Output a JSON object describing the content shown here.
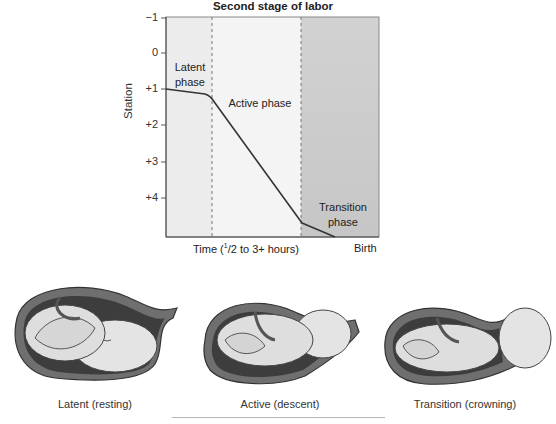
{
  "figure": {
    "title": "Second stage of labor",
    "y_axis_label": "Station",
    "x_axis_label_prefix": "Time (",
    "x_axis_label_sup": "1",
    "x_axis_label_suffix": "/2 to 3+ hours)",
    "x_axis_end_label": "Birth",
    "y_ticks": [
      "−1",
      "0",
      "+1",
      "+2",
      "+3",
      "+4"
    ],
    "phases": [
      {
        "line1": "Latent",
        "line2": "phase"
      },
      {
        "line1": "Active phase",
        "line2": ""
      },
      {
        "line1": "Transition",
        "line2": "phase"
      }
    ],
    "colors": {
      "latent_bg": "#ececec",
      "active_bg": "#f3f3f3",
      "transition_bg": "#cfcfcf",
      "curve": "#333333",
      "divider": "#777777"
    }
  },
  "illustrations": [
    {
      "caption": "Latent (resting)"
    },
    {
      "caption": "Active (descent)"
    },
    {
      "caption": "Transition (crowning)"
    }
  ]
}
